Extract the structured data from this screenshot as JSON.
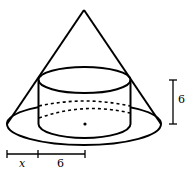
{
  "figure": {
    "labels": {
      "cylinder_height": "6",
      "gap_variable": "x",
      "cylinder_radius": "6"
    },
    "colors": {
      "stroke": "#000000",
      "background": "#ffffff"
    }
  }
}
